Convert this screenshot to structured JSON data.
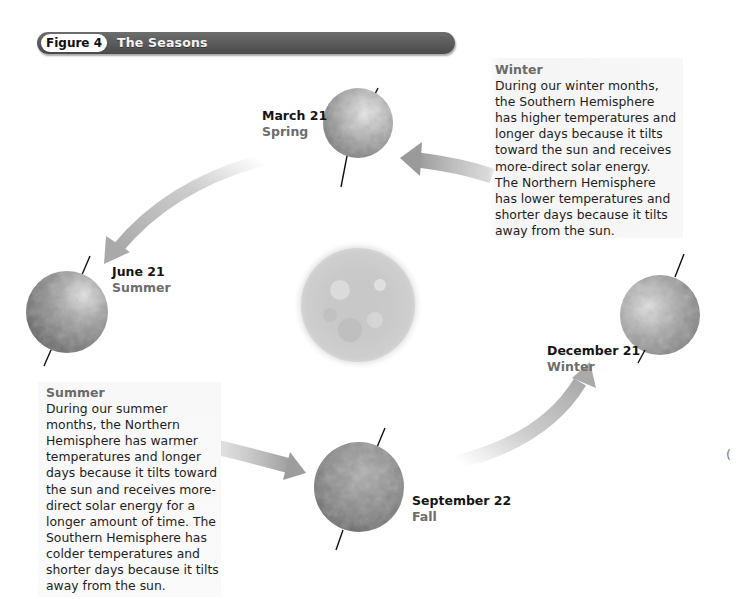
{
  "header": {
    "figure_label": "Figure 4",
    "title": "The Seasons"
  },
  "colors": {
    "header_bar": "#555555",
    "season_text": "#6d6d6d",
    "arrow": "#b5b5b5",
    "sun": "#cfcfcf"
  },
  "positions": [
    {
      "id": "march",
      "date": "March 21",
      "season": "Spring"
    },
    {
      "id": "june",
      "date": "June 21",
      "season": "Summer"
    },
    {
      "id": "september",
      "date": "September 22",
      "season": "Fall"
    },
    {
      "id": "december",
      "date": "December 21",
      "season": "Winter"
    }
  ],
  "winter_box": {
    "title": "Winter",
    "lines": [
      "During our winter months,",
      "the Southern Hemisphere",
      "has higher temperatures and",
      "longer days because it tilts",
      "toward the sun and receives",
      "more-direct solar energy.",
      "The Northern Hemisphere",
      "has lower temperatures and",
      "shorter days because it tilts",
      "away from the sun."
    ]
  },
  "summer_box": {
    "title": "Summer",
    "lines": [
      "During our summer",
      "months, the Northern",
      "Hemisphere has warmer",
      "temperatures and longer",
      "days because it tilts toward",
      "the sun and receives more-",
      "direct solar energy for a",
      "longer amount of time. The",
      "Southern Hemisphere has",
      "colder temperatures and",
      "shorter days because it tilts",
      "away from the sun."
    ]
  },
  "icons": {
    "sun": "sun-icon",
    "earth": "earth-globe-icon",
    "arrow": "orbit-arrow-icon"
  },
  "stray_mark": "("
}
